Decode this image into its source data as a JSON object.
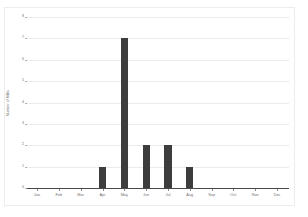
{
  "chart_data": {
    "type": "bar",
    "title": "",
    "subtitle": "",
    "xlabel": "",
    "ylabel": "Number of MAIs",
    "categories": [
      "Jan",
      "Feb",
      "Mar",
      "Apr",
      "May",
      "Jun",
      "Jul",
      "Aug",
      "Sep",
      "Oct",
      "Nov",
      "Dec"
    ],
    "values": [
      0,
      0,
      0,
      1,
      7,
      2,
      2,
      1,
      0,
      0,
      0,
      0
    ],
    "ylim": [
      0,
      8
    ],
    "yticks": [
      "0",
      "1",
      "2",
      "3",
      "4",
      "5",
      "6",
      "7",
      "8"
    ],
    "ytick_values": [
      0,
      1,
      2,
      3,
      4,
      5,
      6,
      7,
      8
    ],
    "grid": true,
    "legend": false,
    "bar_color": "#3d3d3d",
    "gridline_color": "#ebebeb",
    "axis_color": "#4a4a4a",
    "background_color": "#ffffff",
    "tick_label_color": "#6e6e6e"
  }
}
